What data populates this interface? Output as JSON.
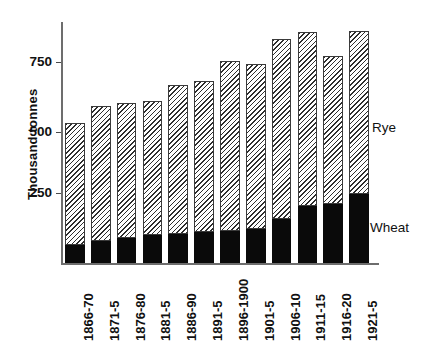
{
  "chart_data": {
    "type": "bar",
    "title": "",
    "subtitle": "",
    "xlabel": "",
    "ylabel": "Thousand tonnes",
    "ylim": [
      0,
      875
    ],
    "yticks": [
      250,
      500,
      750
    ],
    "ytick_labels": [
      "250",
      "500",
      "750"
    ],
    "grid": false,
    "stacked": true,
    "legend_position": "right",
    "categories": [
      "1866-70",
      "1871-5",
      "1876-80",
      "1881-5",
      "1886-90",
      "1891-5",
      "1896-1900",
      "1901-5",
      "1906-10",
      "1911-15",
      "1916-20",
      "1921-5"
    ],
    "series": [
      {
        "name": "Wheat",
        "fill": "solid-black",
        "color": "#0a0a0a",
        "values": [
          65,
          80,
          88,
          100,
          103,
          112,
          116,
          122,
          158,
          203,
          210,
          248
        ]
      },
      {
        "name": "Rye",
        "fill": "diagonal-hatch",
        "color": "#f2f2f2",
        "values": [
          435,
          480,
          482,
          480,
          532,
          538,
          604,
          588,
          642,
          622,
          530,
          582
        ]
      }
    ],
    "totals": [
      500,
      560,
      570,
      580,
      635,
      650,
      720,
      710,
      800,
      825,
      740,
      830
    ],
    "annotations": [
      {
        "text": "Rye",
        "x_px": 372,
        "y_px": 128
      },
      {
        "text": "Wheat",
        "x_px": 370,
        "y_px": 228
      }
    ]
  },
  "legend": {
    "rye_label": "Rye",
    "wheat_label": "Wheat"
  },
  "axes": {
    "y_title": "Thousand tonnes",
    "y_tick_750": "750",
    "y_tick_500": "500",
    "y_tick_250": "250"
  },
  "caption": {
    "text": ""
  }
}
